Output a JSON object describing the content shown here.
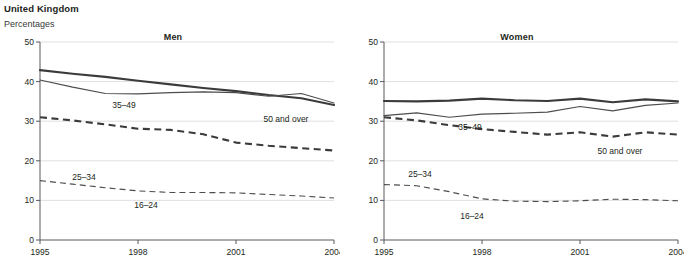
{
  "header": {
    "title": "United Kingdom",
    "subtitle": "Percentages"
  },
  "footnote": {
    "text": ""
  },
  "chart_data": [
    {
      "type": "line",
      "title": "Men",
      "xlabel": "",
      "ylabel": "Percentages",
      "xlim": [
        1995,
        2004
      ],
      "ylim": [
        0,
        50
      ],
      "yticks": [
        0,
        10,
        20,
        30,
        40,
        50
      ],
      "xticks": [
        1995,
        1998,
        2001,
        2004
      ],
      "grid": true,
      "legend": "inline-labels",
      "x": [
        1995,
        1996,
        1997,
        1998,
        1999,
        2000,
        2001,
        2002,
        2003,
        2004
      ],
      "series": [
        {
          "name": "35-49",
          "label": "35–49",
          "style": "thick-solid",
          "values": [
            42.9,
            42.0,
            41.2,
            40.2,
            39.3,
            38.4,
            37.6,
            36.6,
            35.8,
            34.1
          ]
        },
        {
          "name": "50 and over",
          "label": "50 and over",
          "style": "thin-solid",
          "values": [
            40.4,
            38.6,
            37.0,
            36.9,
            37.2,
            37.4,
            37.2,
            36.3,
            37.0,
            34.6
          ]
        },
        {
          "name": "25-34",
          "label": "25–34",
          "style": "thick-dash",
          "values": [
            31.0,
            30.2,
            29.2,
            28.1,
            27.8,
            26.7,
            24.6,
            23.8,
            23.2,
            22.6
          ]
        },
        {
          "name": "16-24",
          "label": "16–24",
          "style": "thin-dash",
          "values": [
            15.0,
            14.1,
            13.2,
            12.4,
            12.0,
            12.0,
            11.9,
            11.5,
            11.1,
            10.6
          ]
        }
      ]
    },
    {
      "type": "line",
      "title": "Women",
      "xlabel": "",
      "ylabel": "Percentages",
      "xlim": [
        1995,
        2004
      ],
      "ylim": [
        0,
        50
      ],
      "yticks": [
        0,
        10,
        20,
        30,
        40,
        50
      ],
      "xticks": [
        1995,
        1998,
        2001,
        2004
      ],
      "grid": true,
      "legend": "inline-labels",
      "x": [
        1995,
        1996,
        1997,
        1998,
        1999,
        2000,
        2001,
        2002,
        2003,
        2004
      ],
      "series": [
        {
          "name": "35-49",
          "label": "35–49",
          "style": "thick-solid",
          "values": [
            35.1,
            35.0,
            35.2,
            35.7,
            35.3,
            35.1,
            35.7,
            34.8,
            35.5,
            35.0
          ]
        },
        {
          "name": "50 and over",
          "label": "50 and over",
          "style": "thin-solid",
          "values": [
            31.4,
            32.1,
            31.0,
            31.8,
            32.0,
            32.3,
            33.7,
            32.6,
            34.0,
            34.6
          ]
        },
        {
          "name": "25-34",
          "label": "25–34",
          "style": "thick-dash",
          "values": [
            31.0,
            30.2,
            29.0,
            28.0,
            27.3,
            26.6,
            27.2,
            26.1,
            27.2,
            26.6
          ]
        },
        {
          "name": "16-24",
          "label": "16–24",
          "style": "thin-dash",
          "values": [
            14.0,
            13.7,
            12.2,
            10.4,
            9.8,
            9.7,
            9.9,
            10.3,
            10.2,
            9.9
          ]
        }
      ]
    }
  ],
  "annotations": {
    "men": {
      "label_35_49": "35–49",
      "label_50_over": "50 and over",
      "label_25_34": "25–34",
      "label_16_24": "16–24"
    },
    "women": {
      "label_35_49": "35–49",
      "label_50_over": "50 and over",
      "label_25_34": "25–34",
      "label_16_24": "16–24"
    }
  }
}
